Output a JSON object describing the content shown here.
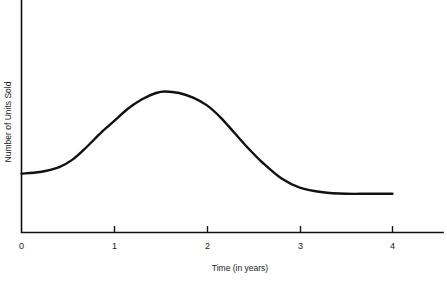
{
  "chart_data": {
    "type": "line",
    "title": "",
    "subtitle": "",
    "xlabel": "Time (in years)",
    "ylabel": "Number of Units Sold",
    "xlim": [
      0,
      4.45
    ],
    "ylim": [
      0,
      1
    ],
    "grid": false,
    "legend": null,
    "annotations": [],
    "xticks": [
      {
        "value": 0,
        "label": "0"
      },
      {
        "value": 1,
        "label": "1"
      },
      {
        "value": 2,
        "label": "2"
      },
      {
        "value": 3,
        "label": "3"
      },
      {
        "value": 4,
        "label": "4"
      }
    ],
    "yticks": [],
    "series": [
      {
        "name": "Product life cycle",
        "x": [
          0.0,
          0.2,
          0.4,
          0.55,
          0.7,
          0.85,
          1.0,
          1.15,
          1.3,
          1.45,
          1.55,
          1.7,
          1.85,
          2.0,
          2.15,
          2.3,
          2.45,
          2.6,
          2.8,
          3.0,
          3.25,
          3.5,
          3.75,
          4.0
        ],
        "y": [
          0.38,
          0.39,
          0.42,
          0.47,
          0.55,
          0.64,
          0.72,
          0.8,
          0.86,
          0.9,
          0.91,
          0.9,
          0.87,
          0.82,
          0.74,
          0.64,
          0.54,
          0.45,
          0.35,
          0.29,
          0.26,
          0.25,
          0.25,
          0.25
        ]
      }
    ]
  },
  "labels": {
    "x_axis_title": "Time (in years)",
    "y_axis_title": "Number of Units Sold",
    "tick_0": "0",
    "tick_1": "1",
    "tick_2": "2",
    "tick_3": "3",
    "tick_4": "4"
  },
  "colors": {
    "curve": "#111111",
    "axis": "#111111",
    "text": "#1a1a1a",
    "background": "#ffffff"
  }
}
